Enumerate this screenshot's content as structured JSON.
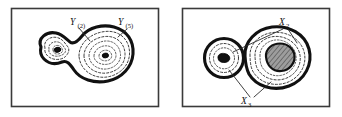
{
  "figure": {
    "panel_count": 2,
    "background_color": "#ffffff",
    "frame_color": "#3a3a3a",
    "ink_color": "#111111",
    "hatch_color": "#8a8a8a"
  },
  "panels": [
    {
      "id": "left",
      "name": "peanut-contour-panel",
      "shape_description": "peanut-shaped region with nested dashed contours and two dark cores",
      "labels": [
        {
          "name": "label-y-2",
          "base": "Y",
          "subscript": "(2)",
          "full": "Y(2)",
          "x": 72,
          "y": 24
        },
        {
          "name": "label-y-5",
          "base": "Y",
          "subscript": "(5)",
          "full": "Y(5)",
          "x": 120,
          "y": 24
        }
      ]
    },
    {
      "id": "right",
      "name": "two-basin-contour-panel",
      "shape_description": "small circular region and large blob with hatched core",
      "labels": [
        {
          "name": "label-x-2",
          "base": "X",
          "subscript": "2",
          "full": "X2",
          "x": 110,
          "y": 23
        },
        {
          "name": "label-x-3",
          "base": "X",
          "subscript": "3",
          "full": "X3",
          "x": 72,
          "y": 101
        }
      ]
    }
  ]
}
